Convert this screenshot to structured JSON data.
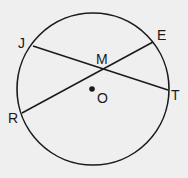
{
  "diagram": {
    "type": "circle-with-intersecting-chords",
    "colors": {
      "background": "#efefef",
      "stroke": "#1a1a1a"
    },
    "circle": {
      "center_label": "O",
      "cx": 93,
      "cy": 89,
      "r": 76
    },
    "points": {
      "J": {
        "label": "J",
        "x": 33,
        "y": 46
      },
      "E": {
        "label": "E",
        "x": 153,
        "y": 42
      },
      "T": {
        "label": "T",
        "x": 168,
        "y": 90
      },
      "R": {
        "label": "R",
        "x": 22,
        "y": 113
      },
      "M": {
        "label": "M",
        "x": 104,
        "y": 69
      },
      "O": {
        "label": "O",
        "x": 92,
        "y": 89
      }
    },
    "chords": [
      {
        "name": "JT",
        "from": "J",
        "to": "T"
      },
      {
        "name": "RE",
        "from": "R",
        "to": "E"
      }
    ]
  }
}
